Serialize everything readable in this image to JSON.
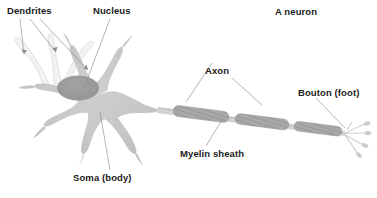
{
  "figure": {
    "title": "A neuron",
    "background_color": "#ffffff",
    "text_color": "#1b1b1b",
    "leader_line_color": "#8c8c8c"
  },
  "labels": {
    "dendrites": "Dendrites",
    "nucleus": "Nucleus",
    "title": "A neuron",
    "axon": "Axon",
    "bouton": "Bouton (foot)",
    "myelin": "Myelin sheath",
    "soma": "Soma (body)"
  },
  "structures": {
    "soma": {
      "name": "Soma (body)",
      "fill_color": "#c9c9c9",
      "edge_color": "#bdbdbd",
      "description": "star-shaped cell body"
    },
    "nucleus": {
      "name": "Nucleus",
      "fill_color": "#9b9b9b",
      "description": "dark gray oval inside soma"
    },
    "dendrites": {
      "name": "Dendrites",
      "fill_color": "#e7e7e7",
      "count": 8,
      "description": "branching projections radiating from soma"
    },
    "axon": {
      "name": "Axon",
      "fill_color": "#cfcfcf",
      "description": "long fiber extending right from soma"
    },
    "myelin_sheath": {
      "name": "Myelin sheath",
      "fill_color": "#a6a6a6",
      "segments": 3,
      "description": "hatched gray capsules along the axon"
    },
    "bouton": {
      "name": "Bouton (foot)",
      "fill_color": "#dcdcdc",
      "terminal_branches": 4,
      "description": "terminal branches at the axon end"
    }
  }
}
